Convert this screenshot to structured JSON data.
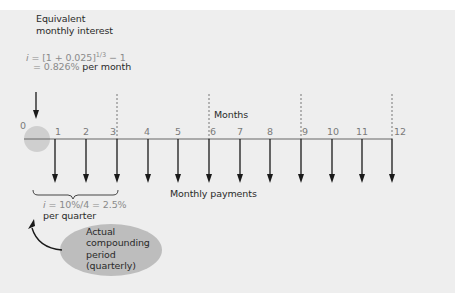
{
  "annotation_top": {
    "title_line1": "Equivalent",
    "title_line2": "monthly interest",
    "formula_var": "i",
    "formula_lhs": " = [1 + 0.025]",
    "formula_exp": "1/3",
    "formula_tail": " − 1",
    "result_prefix": "= ",
    "result_value": "0.826%",
    "result_unit": " per month"
  },
  "timeline": {
    "axis_label": "Months",
    "ticks": [
      "0",
      "1",
      "2",
      "3",
      "4",
      "5",
      "6",
      "7",
      "8",
      "9",
      "10",
      "11",
      "12"
    ],
    "quarter_markers": [
      "3",
      "6",
      "9",
      "12"
    ],
    "payments_label": "Monthly payments"
  },
  "annotation_bottom": {
    "formula_var": "i",
    "formula": " = 10%/4 = 2.5%",
    "unit": "per quarter",
    "bubble_line1": "Actual",
    "bubble_line2": "compounding",
    "bubble_line3": "period",
    "bubble_line4": "(quarterly)"
  },
  "colors": {
    "background": "#eeeeee",
    "line": "#555555",
    "arrow": "#1a1a1a",
    "circle": "#cccccc",
    "bubble": "#bdbdbd",
    "formula_text": "#8a8a8a"
  }
}
